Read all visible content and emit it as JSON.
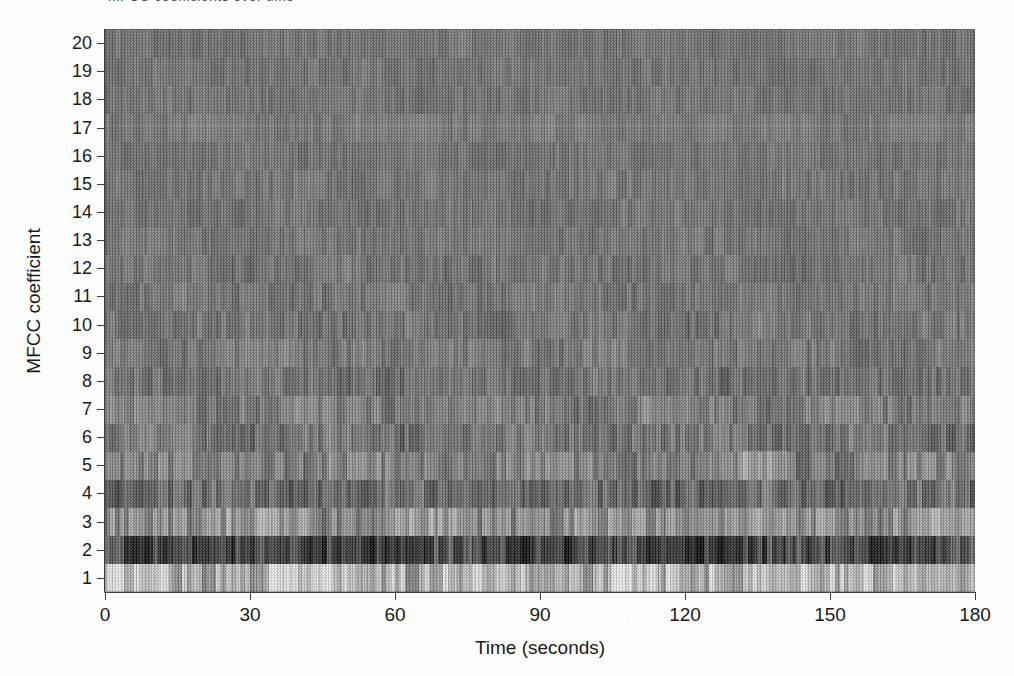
{
  "figure": {
    "clipped_caption_above": "MFCC coefficients over time",
    "background_color": "#fdfdfd",
    "ink_color": "#1a1a1a"
  },
  "chart_data": {
    "type": "heatmap",
    "title": "",
    "xlabel": "Time (seconds)",
    "ylabel": "MFCC coefficient",
    "xlim": [
      0,
      180
    ],
    "ylim": [
      0.5,
      20.5
    ],
    "xticks": [
      0,
      30,
      60,
      90,
      120,
      150,
      180
    ],
    "xtick_labels": [
      "0",
      "30",
      "60",
      "90",
      "120",
      "150",
      "180"
    ],
    "yticks": [
      1,
      2,
      3,
      4,
      5,
      6,
      7,
      8,
      9,
      10,
      11,
      12,
      13,
      14,
      15,
      16,
      17,
      18,
      19,
      20
    ],
    "ytick_labels": [
      "1",
      "2",
      "3",
      "4",
      "5",
      "6",
      "7",
      "8",
      "9",
      "10",
      "11",
      "12",
      "13",
      "14",
      "15",
      "16",
      "17",
      "18",
      "19",
      "20"
    ],
    "grid": false,
    "legend": false,
    "colormap": "grayscale",
    "colorbar": false,
    "x_units": "seconds",
    "y_units": "coefficient index",
    "n_rows": 20,
    "n_time_frames": 180,
    "rows": [
      {
        "coefficient": 1,
        "mean_level": 0.8,
        "contrast": 0.22,
        "note": "brightest band, strong temporal variation"
      },
      {
        "coefficient": 2,
        "mean_level": 0.22,
        "contrast": 0.18,
        "note": "darkest band, heavy vertical striping"
      },
      {
        "coefficient": 3,
        "mean_level": 0.6,
        "contrast": 0.15,
        "note": "light band"
      },
      {
        "coefficient": 4,
        "mean_level": 0.4,
        "contrast": 0.12,
        "note": "medium-dark band"
      },
      {
        "coefficient": 5,
        "mean_level": 0.52,
        "contrast": 0.12,
        "note": "medium band with bright patch near 135 s"
      },
      {
        "coefficient": 6,
        "mean_level": 0.46,
        "contrast": 0.1,
        "note": "medium band"
      },
      {
        "coefficient": 7,
        "mean_level": 0.5,
        "contrast": 0.09,
        "note": "medium band"
      },
      {
        "coefficient": 8,
        "mean_level": 0.45,
        "contrast": 0.08,
        "note": "medium band"
      },
      {
        "coefficient": 9,
        "mean_level": 0.49,
        "contrast": 0.08,
        "note": "medium band"
      },
      {
        "coefficient": 10,
        "mean_level": 0.46,
        "contrast": 0.07,
        "note": "medium band"
      },
      {
        "coefficient": 11,
        "mean_level": 0.47,
        "contrast": 0.06,
        "note": "near-uniform"
      },
      {
        "coefficient": 12,
        "mean_level": 0.46,
        "contrast": 0.06,
        "note": "near-uniform"
      },
      {
        "coefficient": 13,
        "mean_level": 0.47,
        "contrast": 0.05,
        "note": "near-uniform"
      },
      {
        "coefficient": 14,
        "mean_level": 0.46,
        "contrast": 0.05,
        "note": "near-uniform"
      },
      {
        "coefficient": 15,
        "mean_level": 0.47,
        "contrast": 0.05,
        "note": "near-uniform"
      },
      {
        "coefficient": 16,
        "mean_level": 0.46,
        "contrast": 0.04,
        "note": "near-uniform"
      },
      {
        "coefficient": 17,
        "mean_level": 0.49,
        "contrast": 0.04,
        "note": "faint bright horizontal line across full width"
      },
      {
        "coefficient": 18,
        "mean_level": 0.46,
        "contrast": 0.04,
        "note": "near-uniform"
      },
      {
        "coefficient": 19,
        "mean_level": 0.46,
        "contrast": 0.04,
        "note": "near-uniform"
      },
      {
        "coefficient": 20,
        "mean_level": 0.46,
        "contrast": 0.04,
        "note": "near-uniform"
      }
    ],
    "annotations": [
      {
        "text": "bright segment",
        "x_start": 132,
        "x_end": 142,
        "coefficient": 1
      },
      {
        "text": "bright segment",
        "x_start": 166,
        "x_end": 176,
        "coefficient": 1
      },
      {
        "text": "dark segment",
        "x_start": 110,
        "x_end": 124,
        "coefficient": 2
      },
      {
        "text": "bright patch",
        "x_start": 132,
        "x_end": 141,
        "coefficient": 5
      }
    ]
  }
}
